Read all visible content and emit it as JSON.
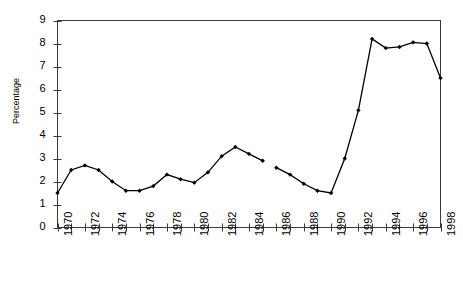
{
  "chart_data": {
    "type": "line",
    "title": "",
    "subtitle": "",
    "xlabel": "",
    "ylabel": "Percentage",
    "xlim": [
      1970,
      1998
    ],
    "ylim": [
      0,
      9
    ],
    "grid": false,
    "legend": null,
    "y_ticks": [
      0,
      1,
      2,
      3,
      4,
      5,
      6,
      7,
      8,
      9
    ],
    "y_tick_labels": [
      "0",
      "1",
      "2",
      "3",
      "4",
      "5",
      "6",
      "7",
      "8",
      "9"
    ],
    "x_ticks": [
      1970,
      1971,
      1972,
      1973,
      1974,
      1975,
      1976,
      1977,
      1978,
      1979,
      1980,
      1981,
      1982,
      1983,
      1984,
      1985,
      1986,
      1987,
      1988,
      1989,
      1990,
      1991,
      1992,
      1993,
      1994,
      1995,
      1996,
      1997,
      1998
    ],
    "x_tick_labels": [
      "1970",
      "",
      "1972",
      "",
      "1974",
      "",
      "1976",
      "",
      "1978",
      "",
      "1980",
      "",
      "1982",
      "",
      "1984",
      "",
      "1986",
      "",
      "1988",
      "",
      "1990",
      "",
      "1992",
      "",
      "1994",
      "",
      "1996",
      "",
      "1998"
    ],
    "marker": "filled-diamond",
    "line_color": "#000000",
    "marker_color": "#000000",
    "line_break_after_x": 1985,
    "x": [
      1970,
      1971,
      1972,
      1973,
      1974,
      1975,
      1976,
      1977,
      1978,
      1979,
      1980,
      1981,
      1982,
      1983,
      1984,
      1985,
      1986,
      1987,
      1988,
      1989,
      1990,
      1991,
      1992,
      1993,
      1994,
      1995,
      1996,
      1997,
      1998
    ],
    "values": [
      1.5,
      2.5,
      2.7,
      2.5,
      2.0,
      1.6,
      1.6,
      1.8,
      2.3,
      2.1,
      1.95,
      2.4,
      3.1,
      3.5,
      3.2,
      2.9,
      2.6,
      2.3,
      1.9,
      1.6,
      1.5,
      3.0,
      5.1,
      8.2,
      7.8,
      7.85,
      8.05,
      8.0,
      6.5
    ]
  }
}
